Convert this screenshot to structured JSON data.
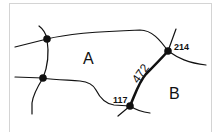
{
  "diagram": {
    "type": "map-parcels",
    "regions": [
      {
        "id": "A",
        "label": "A"
      },
      {
        "id": "B",
        "label": "B"
      }
    ],
    "nodes": [
      {
        "id": "n1",
        "x": 47,
        "y": 39,
        "label": ""
      },
      {
        "id": "n2",
        "x": 43,
        "y": 78,
        "label": ""
      },
      {
        "id": "n214",
        "x": 168,
        "y": 51,
        "label": "214"
      },
      {
        "id": "n117",
        "x": 130,
        "y": 106,
        "label": "117"
      }
    ],
    "highlighted_edge": {
      "from": "117",
      "to": "214",
      "label": "472"
    },
    "colors": {
      "line": "#111111",
      "frame": "#d4d4d4",
      "background": "#ffffff"
    }
  }
}
